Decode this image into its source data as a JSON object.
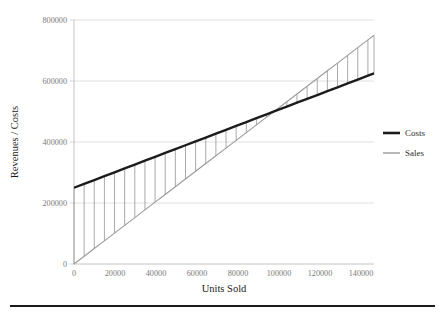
{
  "chart_data": {
    "type": "line",
    "title": "",
    "xlabel": "Units Sold",
    "ylabel": "Revenues / Costs",
    "xlim": [
      0,
      148000
    ],
    "ylim": [
      0,
      800000
    ],
    "grid": true,
    "legend_position": "right",
    "x_ticks": [
      0,
      20000,
      40000,
      60000,
      80000,
      100000,
      120000,
      140000
    ],
    "x_tick_labels": [
      "0",
      "20000",
      "40000",
      "60000",
      "80000",
      "100000",
      "120000",
      "140000"
    ],
    "y_ticks": [
      0,
      200000,
      400000,
      600000,
      800000
    ],
    "y_tick_labels": [
      "0",
      "200000",
      "400000",
      "600000",
      "800000"
    ],
    "x": [
      0,
      5000,
      10000,
      15000,
      20000,
      25000,
      30000,
      35000,
      40000,
      45000,
      50000,
      55000,
      60000,
      65000,
      70000,
      75000,
      80000,
      85000,
      90000,
      95000,
      100000,
      105000,
      110000,
      115000,
      120000,
      125000,
      130000,
      135000,
      140000,
      145000,
      148000
    ],
    "series": [
      {
        "name": "Costs",
        "color": "#1c1c1c",
        "style": "thick-solid",
        "intercept": 250000,
        "slope": 2.5338,
        "values": [
          250000,
          262669,
          275338,
          288007,
          300676,
          313345,
          326014,
          338683,
          351352,
          364021,
          376690,
          389359,
          402028,
          414697,
          427366,
          440035,
          452704,
          465373,
          478042,
          490711,
          503380,
          516049,
          528718,
          541387,
          554056,
          566725,
          579394,
          592063,
          604732,
          617401,
          625000
        ]
      },
      {
        "name": "Sales",
        "color": "#9a9a9a",
        "style": "thin-solid",
        "intercept": 0,
        "slope": 5.0676,
        "values": [
          0,
          25338,
          50676,
          76014,
          101352,
          126690,
          152028,
          177366,
          202704,
          228042,
          253380,
          278718,
          304056,
          329394,
          354732,
          380070,
          405405,
          430743,
          456081,
          481419,
          506757,
          532095,
          557433,
          582771,
          608109,
          633447,
          658785,
          684123,
          709461,
          734799,
          750000
        ]
      }
    ],
    "annotations": {
      "break_even_units": 98645,
      "break_even_value": 499932,
      "hatch_interval_units": 5000,
      "hatch_description": "vertical gray lines connecting Sales and Costs at every 5000 units"
    }
  },
  "legend": {
    "items": [
      {
        "label": "Costs",
        "swatch": "thick-black-line"
      },
      {
        "label": "Sales",
        "swatch": "thin-gray-line"
      }
    ]
  },
  "figure": {
    "bottom_rule": "horizontal-black-rule",
    "caption_fragment": ""
  }
}
